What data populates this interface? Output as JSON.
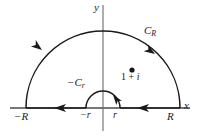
{
  "figure": {
    "width": 197,
    "height": 138,
    "background": "#ffffff",
    "stroke_color": "#1a1a1a"
  },
  "axes": {
    "x_label": "x",
    "y_label": "y",
    "x_axis": {
      "y": 108,
      "x_start": 10,
      "x_end": 190
    },
    "y_axis": {
      "x": 103,
      "y_start": 5,
      "y_end": 131
    },
    "origin": {
      "x": 103,
      "y": 108
    }
  },
  "ticks": [
    {
      "name": "minus-R",
      "label": "−R",
      "x": 26,
      "y": 108
    },
    {
      "name": "minus-r",
      "label": "−r",
      "x": 86,
      "y": 108
    },
    {
      "name": "r",
      "label": "r",
      "x": 120,
      "y": 108
    },
    {
      "name": "R",
      "label": "R",
      "x": 180,
      "y": 108
    }
  ],
  "curves": {
    "outer_arc": {
      "label": "C_R",
      "label_text_main": "C",
      "label_text_sub": "R",
      "radius": 77,
      "center_x": 103,
      "center_y": 108,
      "direction": "counterclockwise"
    },
    "inner_arc": {
      "label": "−C_r",
      "label_text_main": "−C",
      "label_text_sub": "r",
      "radius": 17,
      "center_x": 103,
      "center_y": 108,
      "direction": "clockwise"
    }
  },
  "point": {
    "label_prefix": "1",
    "label_plus": " + ",
    "label_suffix": "i",
    "label_full": "1 + i",
    "x": 132,
    "y": 70
  },
  "arrows": [
    {
      "name": "outer-arc-left-arrow",
      "x": 40,
      "y": 52,
      "angle": 215
    },
    {
      "name": "outer-arc-right-arrow",
      "x": 153,
      "y": 51,
      "angle": 305
    },
    {
      "name": "x-axis-left-arrow",
      "x": 60,
      "y": 108,
      "angle": 0
    },
    {
      "name": "x-axis-right-arrow",
      "x": 143,
      "y": 108,
      "angle": 0
    },
    {
      "name": "inner-arc-arrow",
      "x": 116,
      "y": 97,
      "angle": 55
    }
  ]
}
